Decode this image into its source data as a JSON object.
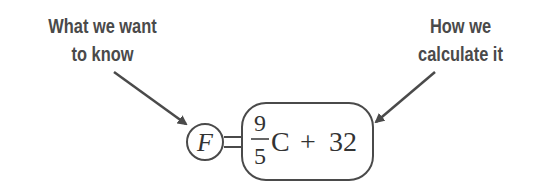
{
  "labels": {
    "left": {
      "line1": "What we want",
      "line2": "to know"
    },
    "right": {
      "line1": "How we",
      "line2": "calculate it"
    }
  },
  "equation": {
    "lhs": "F",
    "equals": "=",
    "numerator": "9",
    "denominator": "5",
    "variable": "C",
    "plus": "+",
    "constant": "32"
  },
  "colors": {
    "stroke": "#4a4a4a",
    "text": "#333333"
  }
}
